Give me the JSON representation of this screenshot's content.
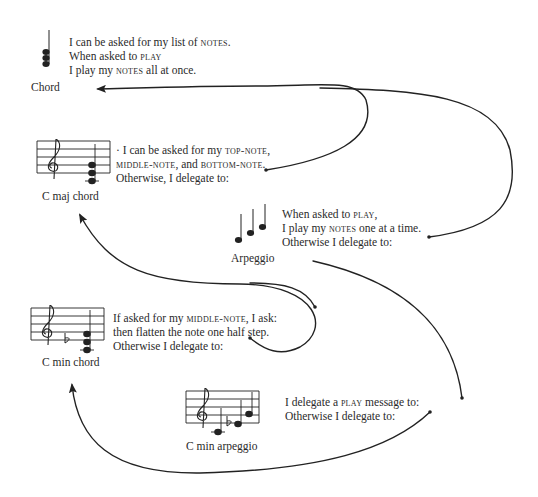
{
  "diagram": {
    "type": "object-delegation-diagram",
    "nodes": [
      {
        "id": "chord",
        "label": "Chord",
        "icon": "stacked-chord-notes-icon",
        "lines": [
          [
            "I can be asked for my list of ",
            {
              "sc": "notes"
            },
            "."
          ],
          [
            "When asked to ",
            {
              "sc": "play"
            }
          ],
          [
            "I play my ",
            {
              "sc": "notes"
            },
            " all at once."
          ]
        ]
      },
      {
        "id": "c-maj-chord",
        "label": "C maj chord",
        "icon": "treble-staff-c-major-chord-icon",
        "lines": [
          [
            "· I can be asked for my ",
            {
              "sc": "top-note"
            },
            ","
          ],
          [
            {
              "sc": "middle-note"
            },
            ", and ",
            {
              "sc": "bottom-note"
            },
            "."
          ],
          [
            "Otherwise, I delegate to:"
          ]
        ]
      },
      {
        "id": "arpeggio",
        "label": "Arpeggio",
        "icon": "ascending-notes-icon",
        "lines": [
          [
            "When asked to ",
            {
              "sc": "play"
            },
            ","
          ],
          [
            "I play my ",
            {
              "sc": "notes"
            },
            " one at a time."
          ],
          [
            "Otherwise I delegate to:"
          ]
        ]
      },
      {
        "id": "c-min-chord",
        "label": "C min chord",
        "icon": "treble-staff-c-minor-chord-icon",
        "lines": [
          [
            "If asked for my ",
            {
              "sc": "middle-note"
            },
            ", I ask:"
          ],
          [
            "then flatten the note one half step."
          ],
          [
            "Otherwise I delegate to:"
          ]
        ]
      },
      {
        "id": "c-min-arpeggio",
        "label": "C min arpeggio",
        "icon": "treble-staff-c-minor-arpeggio-icon",
        "lines": [
          [
            "I delegate a ",
            {
              "sc": "play"
            },
            " message to:"
          ],
          [
            "Otherwise I delegate to:"
          ]
        ]
      }
    ],
    "edges": [
      {
        "from": "c-maj-chord",
        "to": "chord",
        "label": "Otherwise, I delegate to"
      },
      {
        "from": "arpeggio",
        "to": "chord",
        "label": "Otherwise I delegate to"
      },
      {
        "from": "c-min-chord",
        "to": "c-maj-chord",
        "label": "Otherwise I delegate to"
      },
      {
        "from": "c-min-arpeggio",
        "to": "c-min-chord",
        "label": "Otherwise I delegate to"
      },
      {
        "from": "c-min-arpeggio",
        "to": "arpeggio",
        "label": "I delegate a play message to"
      },
      {
        "from": "c-min-chord",
        "to": "c-maj-chord",
        "label": "I ask (middle-note)"
      }
    ]
  },
  "labels": {
    "chord": "Chord",
    "c_maj_chord": "C maj chord",
    "arpeggio": "Arpeggio",
    "c_min_chord": "C min chord",
    "c_min_arpeggio": "C min arpeggio"
  },
  "text": {
    "chord": {
      "l1a": "I can be asked for my list of ",
      "l1b": "notes",
      "l1c": ".",
      "l2a": "When asked to ",
      "l2b": "play",
      "l3a": "I play my ",
      "l3b": "notes",
      "l3c": " all at once."
    },
    "cmaj": {
      "l1a": "· I can be asked for my ",
      "l1b": "top-note",
      "l1c": ",",
      "l2a": "middle-note",
      "l2b": ", and ",
      "l2c": "bottom-note",
      "l2d": ".",
      "l3": "Otherwise, I delegate to:"
    },
    "arpeggio": {
      "l1a": "When asked to ",
      "l1b": "play",
      "l1c": ",",
      "l2a": "I play my ",
      "l2b": "notes",
      "l2c": " one at a time.",
      "l3": "Otherwise I delegate to:"
    },
    "cmin": {
      "l1a": "If asked for my ",
      "l1b": "middle-note",
      "l1c": ", I ask:",
      "l2": "then flatten the note one half step.",
      "l3": "Otherwise I delegate to:"
    },
    "cminarp": {
      "l1a": "I delegate a ",
      "l1b": "play",
      "l1c": " message to:",
      "l2": "Otherwise I delegate to:"
    }
  },
  "colors": {
    "ink": "#222222",
    "background": "#ffffff"
  }
}
